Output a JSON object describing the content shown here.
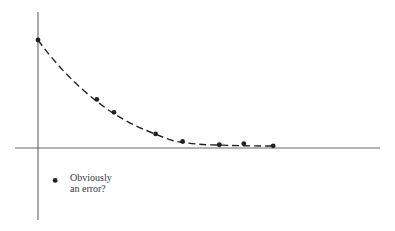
{
  "chart_data": {
    "type": "scatter",
    "title": "",
    "xlabel": "",
    "ylabel": "",
    "grid": false,
    "legend": null,
    "series": [
      {
        "name": "measurements (exponential decay fit)",
        "line_style": "dashed",
        "points": [
          {
            "x": 0.0,
            "y": 1.0
          },
          {
            "x": 0.24,
            "y": 0.45
          },
          {
            "x": 0.31,
            "y": 0.33
          },
          {
            "x": 0.48,
            "y": 0.13
          },
          {
            "x": 0.59,
            "y": 0.06
          },
          {
            "x": 0.74,
            "y": 0.03
          },
          {
            "x": 0.84,
            "y": 0.04
          },
          {
            "x": 0.96,
            "y": 0.02
          }
        ]
      },
      {
        "name": "outlier",
        "points": [
          {
            "x": 0.07,
            "y": -0.3
          }
        ]
      }
    ],
    "annotations": [
      {
        "text": "Obviously an error?",
        "near": "outlier"
      }
    ]
  },
  "annotation": {
    "line1": "Obviously",
    "line2": "an error?"
  },
  "colors": {
    "axis": "#555555",
    "points": "#222222",
    "text": "#3a3a3a"
  }
}
